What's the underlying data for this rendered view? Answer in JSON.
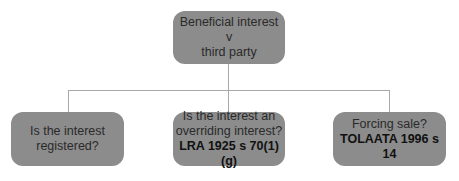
{
  "diagram": {
    "root": {
      "lines": [
        "Beneficial interest",
        "v",
        "third party"
      ]
    },
    "children": [
      {
        "lines": [
          "Is the interest",
          "registered?"
        ],
        "bold": ""
      },
      {
        "lines": [
          "Is the interest an",
          "overriding interest?"
        ],
        "bold": "LRA 1925 s 70(1)(g)"
      },
      {
        "lines": [
          "Forcing sale?"
        ],
        "bold": "TOLAATA 1996 s 14"
      }
    ],
    "colors": {
      "box_fill": "#8c8c8c",
      "connector": "#a8a8a8",
      "text": "#2a2a2a"
    }
  }
}
